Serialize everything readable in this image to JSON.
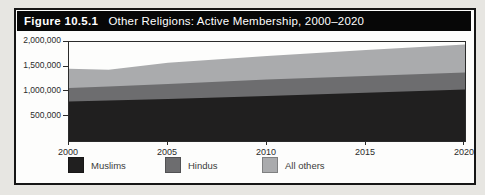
{
  "figure": {
    "label": "Figure 10.5.1",
    "title": "Other Religions: Active Membership, 2000–2020"
  },
  "chart_data": {
    "type": "area",
    "stacked": true,
    "title": "Other Religions: Active Membership, 2000–2020",
    "x": [
      2000,
      2002,
      2005,
      2010,
      2015,
      2020
    ],
    "x_tick_labels": [
      "2000",
      "2005",
      "2010",
      "2015",
      "2020"
    ],
    "x_ticks": [
      2000,
      2005,
      2010,
      2015,
      2020
    ],
    "series": [
      {
        "name": "Muslims",
        "color": "#201f1f",
        "values": [
          800000,
          820000,
          850000,
          910000,
          975000,
          1040000
        ]
      },
      {
        "name": "Hindus",
        "color": "#6d6d6f",
        "values": [
          270000,
          280000,
          300000,
          335000,
          340000,
          345000
        ]
      },
      {
        "name": "All others",
        "color": "#aaabad",
        "values": [
          390000,
          340000,
          430000,
          475000,
          525000,
          565000
        ]
      }
    ],
    "stacked_totals": [
      1460000,
      1440000,
      1580000,
      1720000,
      1840000,
      1950000
    ],
    "xlabel": "",
    "ylabel": "",
    "ylim": [
      0,
      2000000
    ],
    "y_ticks": [
      500000,
      1000000,
      1500000,
      2000000
    ],
    "y_tick_labels": [
      "500,000",
      "1,000,000",
      "1,500,000",
      "2,000,000"
    ],
    "grid": false,
    "legend_position": "bottom"
  },
  "colors": {
    "page_background": "#e7e6e2",
    "figure_background": "#fdfdfc",
    "header_background": "#070707",
    "header_text": "#ffffff",
    "axis": "#2b2b2b"
  }
}
